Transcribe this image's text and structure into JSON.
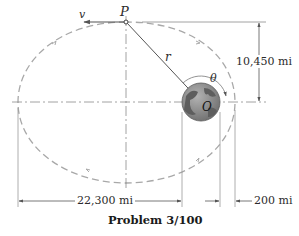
{
  "diagram": {
    "caption": "Problem 3/100",
    "labels": {
      "point_p": "P",
      "velocity": "v",
      "radius": "r",
      "angle": "θ",
      "center_o": "O"
    },
    "dimensions": {
      "vertical": "10,450 mi",
      "horizontal": "22,300 mi",
      "altitude": "200 mi"
    },
    "colors": {
      "line": "#555555",
      "orbit_dash": "#a8a8a8",
      "earth_ocean": "#8a8a8a",
      "earth_land": "#5e5e5e",
      "text": "#2b2b2b"
    }
  }
}
